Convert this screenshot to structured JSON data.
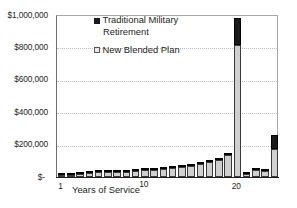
{
  "chart_data": {
    "type": "bar",
    "title": "",
    "subtitle": "",
    "xlabel": "Years of Service",
    "ylabel": "",
    "grid": true,
    "stacked_overlay": true,
    "legend_position": "top-center",
    "ylim": [
      0,
      1000000
    ],
    "ytick_values": [
      1000000,
      800000,
      600000,
      400000,
      200000,
      0
    ],
    "ytick_labels": [
      "$1,000,000",
      "$800,000",
      "$600,000",
      "$400,000",
      "$200,000",
      "$-"
    ],
    "xtick_values": [
      1,
      10,
      20
    ],
    "xtick_labels": [
      "1",
      "10",
      "20"
    ],
    "categories": [
      1,
      2,
      3,
      4,
      5,
      6,
      7,
      8,
      9,
      10,
      11,
      12,
      13,
      14,
      15,
      16,
      17,
      18,
      19,
      20,
      21,
      22,
      23,
      24
    ],
    "series": [
      {
        "name": "Traditional Military Retirement",
        "color": "#1a1a1a",
        "values": [
          14000,
          15000,
          24000,
          30000,
          33000,
          34000,
          36000,
          38000,
          42000,
          45000,
          50000,
          55000,
          60000,
          66000,
          74000,
          86000,
          100000,
          120000,
          150000,
          980000,
          22000,
          48000,
          45000,
          260000
        ]
      },
      {
        "name": "New Blended Plan",
        "color": "#cfcfcf",
        "values": [
          12000,
          13000,
          20000,
          26000,
          30000,
          30000,
          32000,
          34000,
          38000,
          41000,
          45000,
          50000,
          55000,
          60000,
          67000,
          78000,
          90000,
          108000,
          133000,
          815000,
          20000,
          42000,
          40000,
          172000
        ]
      }
    ],
    "annotations": []
  },
  "legend": {
    "items": [
      {
        "label_line1": "Traditional Military",
        "label_line2": "Retirement",
        "swatch": "black-square-icon"
      },
      {
        "label_line1": "New Blended Plan",
        "label_line2": "",
        "swatch": "white-square-icon"
      }
    ]
  }
}
